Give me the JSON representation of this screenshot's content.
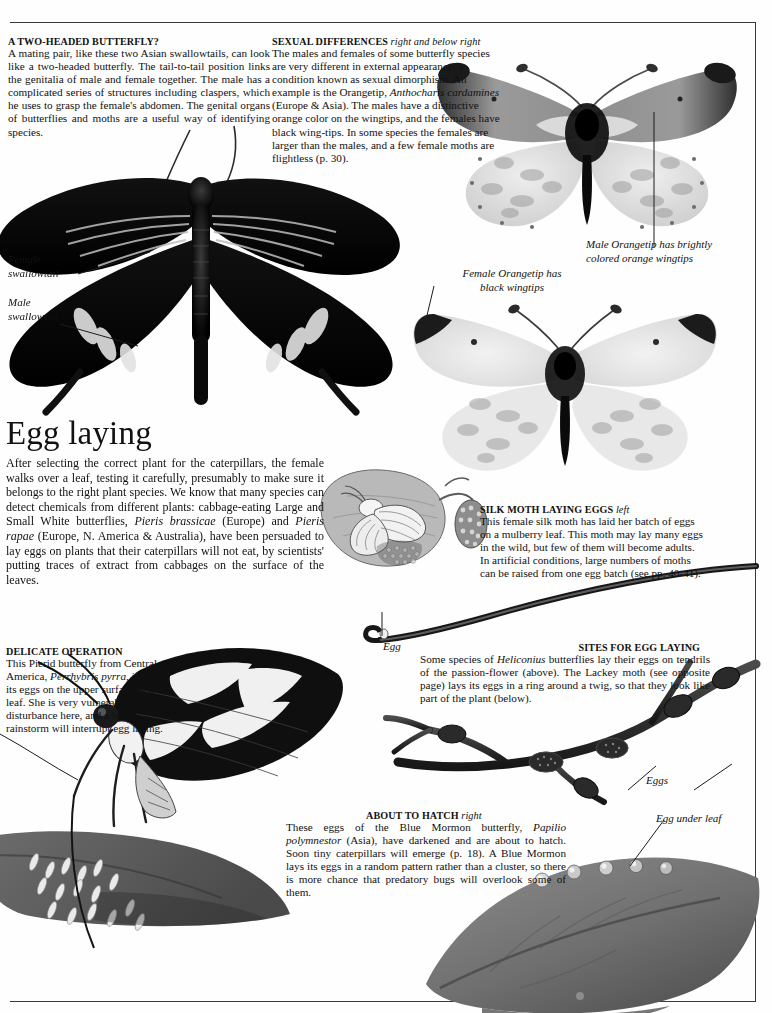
{
  "page": {
    "section_title": "Egg laying"
  },
  "blocks": {
    "two_headed": {
      "heading": "A TWO-HEADED BUTTERFLY?",
      "body": "A mating pair, like these two Asian swallowtails, can look like a two-headed butterfly. The tail-to-tail position links the genitalia of male and female together. The male has a complicated series of structures including claspers, which he uses to grasp the female's abdomen. The genital organs of butterflies and moths are a useful way of identifying species."
    },
    "sexual_differences": {
      "heading": "SEXUAL DIFFERENCES",
      "heading_italic": "right and below right",
      "body_1": "The males and females of some butterfly species are very different in external appearance, a condition known as sexual dimorphism. An example is the Orangetip, ",
      "body_italic_1": "Anthocharis cardamines",
      "body_2": " (Europe & Asia). The males have a distinctive orange color on the wingtips, and the females have black wing-tips. In some species the females are larger than the males, and a few female moths are flightless (p. 30)."
    },
    "egg_laying": {
      "body_1": "After selecting the correct plant for the caterpillars, the female walks over a leaf, testing it carefully, presumably to make sure it belongs to the right plant species. We know that many species can detect chemicals from different plants: cabbage-eating Large and Small White butterflies, ",
      "body_italic_1": "Pieris brassicae",
      "body_2": " (Europe) and ",
      "body_italic_2": "Pieris rapae",
      "body_3": " (Europe, N. America & Australia), have been persuaded to lay eggs on plants that their caterpillars will not eat, by scientists' putting traces of extract from cabbages on the surface of the leaves."
    },
    "silk_moth": {
      "heading": "SILK MOTH  LAYING EGGS",
      "heading_italic": "left",
      "body": "This female silk moth has laid her batch of eggs on a mulberry leaf. This moth may lay many eggs in the wild, but few of them will become adults. In artificial conditions, large numbers of moths can be raised from one egg batch (see pp. 40-41)."
    },
    "delicate_operation": {
      "heading": "DELICATE OPERATION",
      "body_1": "This Pierid butterfly from Central America, ",
      "body_italic_1": "Perrhybris pyrra",
      "body_2": ",  is laying its eggs on the upper surface of the leaf. She is very vulnerable to disturbance here, and a heavy rainstorm will interrupt egg laying."
    },
    "sites_for_egg_laying": {
      "heading": "SITES FOR EGG LAYING",
      "body_1": "Some species of ",
      "body_italic_1": "Heliconius",
      "body_2": " butterflies lay their eggs on tendrils  of the passion-flower (above). The Lackey moth (see opposite page) lays its eggs in a ring around a twig, so that they look like part of the plant (below)."
    },
    "about_to_hatch": {
      "heading": "ABOUT TO HATCH",
      "heading_italic": "right",
      "body_1": "These eggs of the Blue Mormon butterfly, ",
      "body_italic_1": "Papilio  polymnestor",
      "body_2": " (Asia), have darkened and are about to hatch. Soon tiny caterpillars will emerge (p. 18). A Blue Mormon lays its eggs in a random pattern rather than a cluster, so there is more chance that predatory bugs will overlook some of them."
    }
  },
  "labels": {
    "female_swallowtail": "Female\nswallowtail",
    "male_swallowtail": "Male\nswallowtail",
    "male_orangetip": "Male Orangetip has brightly\ncolored orange wingtips",
    "female_orangetip": "Female Orangetip has\nblack wingtips",
    "egg": "Egg",
    "eggs": "Eggs",
    "egg_under_leaf": "Egg under leaf"
  },
  "colors": {
    "ink": "#111111",
    "rule": "#3a3a3a",
    "paper": "#fefefe",
    "photo_dark": "#0d0d0d",
    "photo_mid": "#8e8e8e",
    "photo_light": "#d8d8d8"
  }
}
